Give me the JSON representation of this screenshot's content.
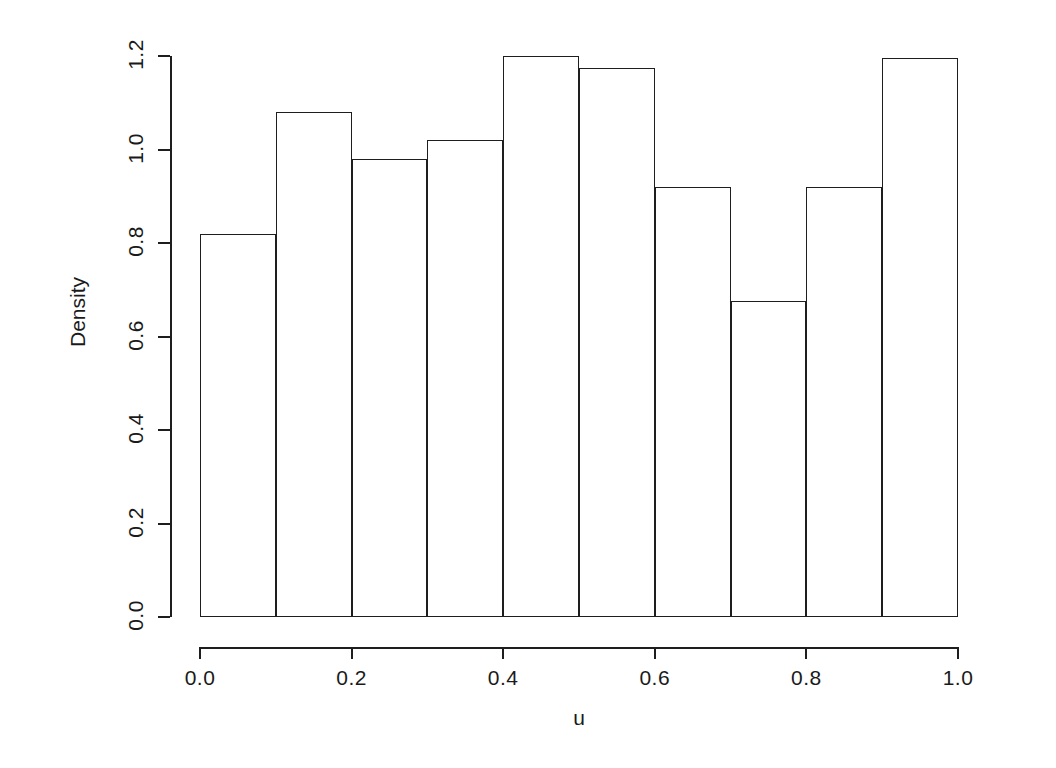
{
  "chart_data": {
    "type": "bar",
    "title": "",
    "subtitle": "",
    "xlabel": "u",
    "ylabel": "Density",
    "xlim": [
      0.0,
      1.0
    ],
    "ylim": [
      0.0,
      1.2
    ],
    "grid": false,
    "legend": null,
    "bin_width": 0.1,
    "bin_edges": [
      0.0,
      0.1,
      0.2,
      0.3,
      0.4,
      0.5,
      0.6,
      0.7,
      0.8,
      0.9,
      1.0
    ],
    "categories": [
      "0.0-0.1",
      "0.1-0.2",
      "0.2-0.3",
      "0.3-0.4",
      "0.4-0.5",
      "0.5-0.6",
      "0.6-0.7",
      "0.7-0.8",
      "0.8-0.9",
      "0.9-1.0"
    ],
    "values": [
      0.82,
      1.08,
      0.98,
      1.02,
      1.2,
      1.175,
      0.92,
      0.675,
      0.92,
      1.195
    ],
    "x_ticks": [
      0.0,
      0.2,
      0.4,
      0.6,
      0.8,
      1.0
    ],
    "x_tick_labels": [
      "0.0",
      "0.2",
      "0.4",
      "0.6",
      "0.8",
      "1.0"
    ],
    "y_ticks": [
      0.0,
      0.2,
      0.4,
      0.6,
      0.8,
      1.0,
      1.2
    ],
    "y_tick_labels": [
      "0.0",
      "0.2",
      "0.4",
      "0.6",
      "0.8",
      "1.0",
      "1.2"
    ],
    "bar_fill_color": "#ffffff",
    "bar_border_color": "#1e1e1e",
    "axis_color": "#1e1e1e",
    "background_color": "#ffffff"
  },
  "axis": {
    "y_title": "Density",
    "x_title": "u"
  }
}
